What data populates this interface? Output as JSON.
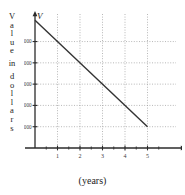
{
  "chart_data": {
    "type": "line",
    "title": "",
    "subtitle": "",
    "xlabel": "(years)",
    "ylabel": "Value in dollars",
    "x_axis_name": "t",
    "y_axis_name": "V",
    "x": [
      0,
      1,
      2,
      3,
      4,
      5
    ],
    "values": [
      6000,
      5000,
      4000,
      3000,
      2000,
      1000
    ],
    "series": [
      {
        "name": "V",
        "x": [
          0,
          5
        ],
        "values": [
          6000,
          1000
        ]
      }
    ],
    "xlim": [
      0,
      6
    ],
    "ylim": [
      0,
      6200
    ],
    "xticks": [
      1,
      2,
      3,
      4,
      5
    ],
    "xticklabels": [
      "1",
      "2",
      "3",
      "4",
      "5"
    ],
    "yticks": [
      1000,
      2000,
      3000,
      4000,
      5000
    ],
    "yticklabels": [
      "1000",
      "2000",
      "3000",
      "4000",
      "5000"
    ],
    "grid": true,
    "grid_style": "dotted",
    "legend": false,
    "legend_position": "none",
    "line_color": "#333333",
    "grid_color": "#9a9a9a",
    "axis_color": "#2b2b2b",
    "annotations": []
  },
  "axis_labels": {
    "vertical_caption_chars": [
      "V",
      "a",
      "l",
      "u",
      "e",
      "in",
      "d",
      "o",
      "l",
      "l",
      "a",
      "r",
      "s"
    ],
    "x_caption": "(years)",
    "y_axis_symbol": "V",
    "x_axis_symbol": "t"
  }
}
